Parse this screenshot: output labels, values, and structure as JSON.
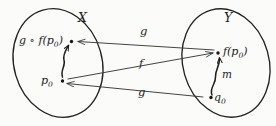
{
  "figure": {
    "kind": "function-composition-diagram",
    "background_color": "#fbfbfa",
    "ink_color": "#1f1f1f",
    "width": 276,
    "height": 126
  },
  "sets": [
    {
      "id": "X",
      "label": "X",
      "side": "left"
    },
    {
      "id": "Y",
      "label": "Y",
      "side": "right"
    }
  ],
  "points": [
    {
      "id": "gfp0",
      "label": "g ∘ f(p",
      "sub": "0",
      "tail": ")",
      "set": "X",
      "x": 68,
      "y": 41
    },
    {
      "id": "p0",
      "label": "p",
      "sub": "0",
      "tail": "",
      "set": "X",
      "x": 57,
      "y": 81
    },
    {
      "id": "fp0",
      "label": "f(p",
      "sub": "0",
      "tail": ")",
      "set": "Y",
      "x": 221,
      "y": 52
    },
    {
      "id": "q0",
      "label": "q",
      "sub": "0",
      "tail": "",
      "set": "Y",
      "x": 208,
      "y": 98
    }
  ],
  "arrows": [
    {
      "id": "g-top",
      "label": "g",
      "from": "fp0",
      "to": "gfp0",
      "label_x": 140,
      "label_y": 33
    },
    {
      "id": "f-mid",
      "label": "f",
      "from": "p0",
      "to": "fp0",
      "label_x": 139,
      "label_y": 64
    },
    {
      "id": "g-bottom",
      "label": "g",
      "from": "q0",
      "to": "p0",
      "label_x": 138,
      "label_y": 92
    }
  ],
  "curves": [
    {
      "id": "path-in-X",
      "label": "",
      "from": "p0",
      "to": "gfp0",
      "set": "X"
    },
    {
      "id": "path-in-Y",
      "label": "m",
      "from": "q0",
      "to": "fp0",
      "set": "Y",
      "label_x": 222,
      "label_y": 74
    }
  ],
  "set_labels": {
    "X_x": 78,
    "X_y": 12,
    "Y_x": 224,
    "Y_y": 12
  }
}
